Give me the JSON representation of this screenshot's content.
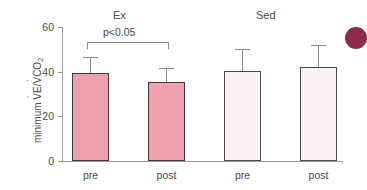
{
  "chart_data": {
    "type": "bar",
    "title": "",
    "subtitle": "",
    "xlabel": "",
    "ylabel": "minimum V̇E/V̇CO2",
    "ylabel_parts": {
      "prefix": "minimum ",
      "v1": "V",
      "mid": "E/",
      "v2": "V",
      "suffix": "CO",
      "subscript": "2"
    },
    "ylim": [
      0,
      60
    ],
    "yticks": [
      0,
      20,
      40,
      60
    ],
    "ytick_labels": [
      "0",
      "20",
      "40",
      "60"
    ],
    "grid": false,
    "legend": "none",
    "groups": [
      {
        "name": "Ex",
        "label": "Ex"
      },
      {
        "name": "Sed",
        "label": "Sed"
      }
    ],
    "categories": [
      "pre",
      "post",
      "pre",
      "post"
    ],
    "values": [
      39.2,
      35.5,
      40.4,
      42.3
    ],
    "errors_upper": [
      7.5,
      6.3,
      9.6,
      9.7
    ],
    "error_tops": [
      46.7,
      41.8,
      50.0,
      52.0
    ],
    "bars": [
      {
        "group": "Ex",
        "category": "pre",
        "value": 39.2,
        "error_top": 46.7,
        "fill": "#efa0ae",
        "stroke": "#3c3c3c"
      },
      {
        "group": "Ex",
        "category": "post",
        "value": 35.5,
        "error_top": 41.8,
        "fill": "#efa0ae",
        "stroke": "#3c3c3c"
      },
      {
        "group": "Sed",
        "category": "pre",
        "value": 40.4,
        "error_top": 50.0,
        "fill": "#fbf2f3",
        "stroke": "#4a4a4a"
      },
      {
        "group": "Sed",
        "category": "post",
        "value": 42.3,
        "error_top": 52.0,
        "fill": "#fbf2f3",
        "stroke": "#4a4a4a"
      }
    ],
    "annotations": [
      {
        "name": "significance-bracket",
        "text": "p<0.05",
        "from_category": "pre",
        "to_category": "post",
        "group": "Ex"
      }
    ],
    "colors": {
      "ex_fill": "#efa0ae",
      "sed_fill": "#fbf2f3",
      "bar_stroke": "#3c3c3c",
      "axis": "#9a9a9a",
      "error_bar": "#8c8c8c",
      "text": "#4a4a4a",
      "corner_dot": "#8e2b4e"
    }
  },
  "decoration": {
    "corner_dot_name": "page-accent-dot",
    "corner_dot_color": "#8e2b4e"
  }
}
